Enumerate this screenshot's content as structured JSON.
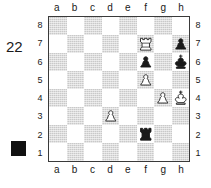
{
  "diagram": {
    "number": "22",
    "side_to_move_marker": "black-filled-square",
    "side_to_move": "black",
    "files_top": [
      "a",
      "b",
      "c",
      "d",
      "e",
      "f",
      "g",
      "h"
    ],
    "files_bottom": [
      "a",
      "b",
      "c",
      "d",
      "e",
      "f",
      "g",
      "h"
    ],
    "ranks_left": [
      "8",
      "7",
      "6",
      "5",
      "4",
      "3",
      "2",
      "1"
    ],
    "ranks_right": [
      "8",
      "7",
      "6",
      "5",
      "4",
      "3",
      "2",
      "1"
    ],
    "colors": {
      "light_square": "#ffffff",
      "dark_square": "#c9c9c9",
      "border": "#3a3a3a",
      "black_piece": "#1a1a1a",
      "white_piece": "#ffffff",
      "text": "#1a1a1a"
    },
    "pieces": [
      {
        "square": "f7",
        "color": "white",
        "type": "rook",
        "glyph": "white-rook-icon"
      },
      {
        "square": "h7",
        "color": "black",
        "type": "pawn",
        "glyph": "black-pawn-icon"
      },
      {
        "square": "f6",
        "color": "black",
        "type": "pawn",
        "glyph": "black-pawn-icon"
      },
      {
        "square": "h6",
        "color": "black",
        "type": "king",
        "glyph": "black-king-icon"
      },
      {
        "square": "f5",
        "color": "white",
        "type": "pawn",
        "glyph": "white-pawn-icon"
      },
      {
        "square": "g4",
        "color": "white",
        "type": "pawn",
        "glyph": "white-pawn-icon"
      },
      {
        "square": "h4",
        "color": "white",
        "type": "king",
        "glyph": "white-king-icon"
      },
      {
        "square": "d3",
        "color": "white",
        "type": "pawn",
        "glyph": "white-pawn-icon"
      },
      {
        "square": "f2",
        "color": "black",
        "type": "rook",
        "glyph": "black-rook-icon"
      }
    ]
  }
}
